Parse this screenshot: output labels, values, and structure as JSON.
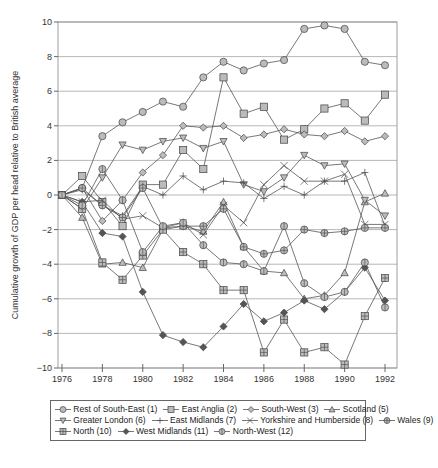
{
  "chart_data": {
    "type": "line",
    "title": "",
    "xlabel": "",
    "ylabel": "Cumulative growth of GDP per head relative to British average",
    "x": [
      1976,
      1977,
      1978,
      1979,
      1980,
      1981,
      1982,
      1983,
      1984,
      1985,
      1986,
      1987,
      1988,
      1989,
      1990,
      1991,
      1992
    ],
    "xticks": [
      "1976",
      "1978",
      "1980",
      "1982",
      "1984",
      "1986",
      "1988",
      "1990",
      "1992"
    ],
    "xlim": [
      1976,
      1992
    ],
    "yticks": [
      "10",
      "8",
      "6",
      "4",
      "2",
      "0",
      "-2",
      "-4",
      "-6",
      "-8",
      "-10"
    ],
    "ylim": [
      -10,
      10
    ],
    "grid": "horizontal",
    "legend_position": "bottom",
    "series": [
      {
        "name": "Rest of South-East (1)",
        "marker": "circle",
        "values": [
          0,
          0.4,
          3.4,
          4.2,
          4.8,
          5.4,
          5.1,
          6.8,
          7.7,
          7.2,
          7.6,
          7.8,
          9.6,
          9.8,
          9.6,
          7.7,
          7.5
        ]
      },
      {
        "name": "East Anglia (2)",
        "marker": "square",
        "values": [
          0,
          1.1,
          -0.4,
          -1.8,
          0.6,
          0.6,
          2.6,
          1.5,
          6.8,
          4.7,
          5.1,
          3.2,
          3.8,
          5.0,
          5.3,
          4.3,
          5.8
        ]
      },
      {
        "name": "South-West (3)",
        "marker": "diamond",
        "values": [
          0,
          0.4,
          -1.5,
          -0.3,
          1.3,
          2.3,
          4.0,
          3.9,
          4.0,
          3.3,
          3.5,
          3.8,
          3.5,
          3.4,
          3.7,
          3.1,
          3.4
        ]
      },
      {
        "name": "Scotland (5)",
        "marker": "triangle-up",
        "values": [
          0,
          -1.3,
          -4.0,
          -3.9,
          -4.2,
          -2.0,
          -1.8,
          -2.1,
          -0.4,
          -3.0,
          -4.4,
          -4.5,
          -6.0,
          -5.8,
          -4.5,
          -0.4,
          0.1
        ]
      },
      {
        "name": "Greater London (6)",
        "marker": "triangle-down",
        "values": [
          0,
          -0.8,
          1.0,
          2.9,
          2.6,
          3.1,
          3.3,
          2.7,
          3.1,
          0.6,
          0.2,
          1.0,
          2.3,
          1.7,
          1.8,
          -0.3,
          -1.2
        ]
      },
      {
        "name": "East Midlands (7)",
        "marker": "plus",
        "values": [
          0,
          0.3,
          -0.6,
          -1.2,
          0.5,
          0.0,
          1.1,
          0.3,
          0.8,
          0.7,
          -0.2,
          0.5,
          0.0,
          0.8,
          0.8,
          1.3,
          -1.8
        ]
      },
      {
        "name": "Yorkshire and Humberside (8)",
        "marker": "x",
        "values": [
          0,
          -0.4,
          -0.3,
          -1.4,
          -1.2,
          -1.9,
          -1.6,
          -2.3,
          -0.6,
          -1.6,
          0.6,
          1.7,
          0.8,
          0.8,
          1.2,
          -1.7,
          -1.7
        ]
      },
      {
        "name": "Wales (9)",
        "marker": "circle-cross",
        "values": [
          0,
          0.4,
          -0.6,
          -1.3,
          0.4,
          -1.9,
          -1.8,
          -1.8,
          -0.8,
          -3.0,
          -3.4,
          -3.2,
          -2.0,
          -2.2,
          -2.1,
          -1.9,
          -1.9
        ]
      },
      {
        "name": "North (10)",
        "marker": "square-cross",
        "values": [
          0,
          -0.8,
          -3.9,
          -4.9,
          -3.5,
          -2.0,
          -3.3,
          -4.0,
          -5.5,
          -5.5,
          -9.1,
          -7.2,
          -9.1,
          -8.8,
          -9.8,
          -7.0,
          -4.8
        ]
      },
      {
        "name": "West Midlands (11)",
        "marker": "diamond-filled",
        "values": [
          0,
          -0.4,
          -2.2,
          -2.4,
          -5.6,
          -8.1,
          -8.5,
          -8.8,
          -7.6,
          -6.3,
          -7.3,
          -6.8,
          -6.1,
          -6.6,
          -5.6,
          -4.2,
          -6.1
        ]
      },
      {
        "name": "North-West (12)",
        "marker": "circle-vbar",
        "values": [
          0,
          -0.6,
          1.5,
          -0.3,
          -3.3,
          -1.8,
          -1.6,
          -2.9,
          -3.9,
          -4.0,
          -4.4,
          -1.8,
          -5.1,
          -5.9,
          -5.6,
          -3.9,
          -6.5
        ]
      }
    ]
  }
}
